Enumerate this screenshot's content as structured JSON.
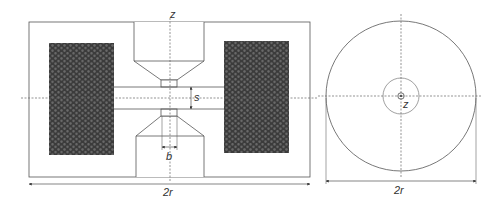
{
  "diagram": {
    "type": "electromagnet cross-section and top view",
    "colors": {
      "line": "#555555",
      "axis": "#666666",
      "coil_fill": "#3b3b3b",
      "coil_cell": "#6a6a6a",
      "background": "#ffffff"
    },
    "side_view": {
      "labels": {
        "axis_z": "z",
        "gap": "s",
        "neck_width": "b",
        "width": "2r"
      },
      "components": [
        "outer-housing",
        "left-coil",
        "right-coil",
        "top-pole-piece",
        "bottom-pole-piece",
        "air-gap-channel"
      ]
    },
    "top_view": {
      "labels": {
        "axis_z": "z",
        "width": "2r"
      },
      "components": [
        "outer-circle",
        "inner-circle",
        "center-circle",
        "center-dot"
      ]
    }
  }
}
